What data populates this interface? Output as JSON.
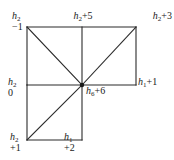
{
  "figure": {
    "kind": "mesh-node-diagram",
    "width": 174,
    "height": 160,
    "background_color": "#ffffff",
    "line_color": "#2b2b2b",
    "text_color": "#1b1b1b"
  },
  "nodes": {
    "top_left": {
      "symbol": "h",
      "subscript": "2",
      "value": "−1",
      "layout": "stacked",
      "align": "left"
    },
    "top_center": {
      "symbol": "h",
      "subscript": "2",
      "value": "+5",
      "layout": "inline",
      "align": "center"
    },
    "top_right": {
      "symbol": "h",
      "subscript": "2",
      "value": "+3",
      "layout": "inline",
      "align": "right"
    },
    "mid_left": {
      "symbol": "h",
      "subscript": "2",
      "value": "0",
      "layout": "stacked",
      "align": "left"
    },
    "center": {
      "symbol": "h",
      "subscript": "6",
      "value": "+6",
      "layout": "inline",
      "align": "left"
    },
    "mid_right": {
      "symbol": "h",
      "subscript": "1",
      "value": "+1",
      "layout": "inline",
      "align": "left"
    },
    "bottom_left": {
      "symbol": "h",
      "subscript": "2",
      "value": "+1",
      "layout": "stacked",
      "align": "left"
    },
    "bottom_center": {
      "symbol": "h",
      "subscript": "1",
      "value": "+2",
      "layout": "stacked",
      "align": "left"
    }
  },
  "geometry": {
    "left_x": 27,
    "mid_x": 82,
    "right_x": 136,
    "top_y": 27,
    "mid_y": 85,
    "bottom_y": 140,
    "center_dot_radius": 2.2,
    "stroke_width": 1.1,
    "edges": [
      {
        "name": "top-edge",
        "x1": 27,
        "y1": 27,
        "x2": 136,
        "y2": 27
      },
      {
        "name": "upper-left-vertical",
        "x1": 27,
        "y1": 27,
        "x2": 27,
        "y2": 85
      },
      {
        "name": "mid-horizontal",
        "x1": 27,
        "y1": 85,
        "x2": 136,
        "y2": 85
      },
      {
        "name": "right-vertical",
        "x1": 136,
        "y1": 27,
        "x2": 136,
        "y2": 85
      },
      {
        "name": "center-vertical",
        "x1": 82,
        "y1": 27,
        "x2": 82,
        "y2": 140
      },
      {
        "name": "lower-left-vertical",
        "x1": 27,
        "y1": 85,
        "x2": 27,
        "y2": 140
      },
      {
        "name": "bottom-edge",
        "x1": 27,
        "y1": 140,
        "x2": 82,
        "y2": 140
      },
      {
        "name": "diagonal-upper-left",
        "x1": 27,
        "y1": 27,
        "x2": 82,
        "y2": 85
      },
      {
        "name": "diagonal-upper-right",
        "x1": 82,
        "y1": 85,
        "x2": 136,
        "y2": 27
      },
      {
        "name": "diagonal-lower-left",
        "x1": 27,
        "y1": 140,
        "x2": 82,
        "y2": 85
      }
    ]
  }
}
